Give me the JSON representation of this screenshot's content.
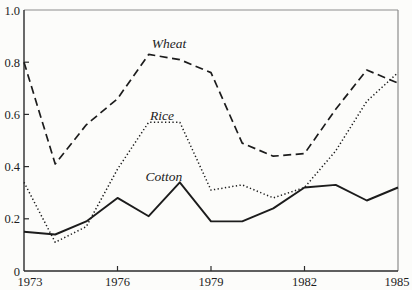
{
  "colors": {
    "background": "#fcfcfa",
    "line": "#1c1c1c",
    "axis_main": "#2b2b2b",
    "axis_frame": "#8c8c8c"
  },
  "chart_data": {
    "type": "line",
    "title": "",
    "xlabel": "",
    "ylabel": "",
    "grid": false,
    "legend_position": "inline-labels",
    "xlim": [
      1973,
      1985
    ],
    "ylim": [
      0,
      1.0
    ],
    "x": [
      1973,
      1974,
      1975,
      1976,
      1977,
      1978,
      1979,
      1980,
      1981,
      1982,
      1983,
      1984,
      1985
    ],
    "series": [
      {
        "name": "Wheat",
        "line_style": "dashed",
        "values": [
          0.8,
          0.41,
          0.56,
          0.66,
          0.83,
          0.81,
          0.76,
          0.49,
          0.44,
          0.45,
          0.62,
          0.77,
          0.72
        ]
      },
      {
        "name": "Rice",
        "line_style": "dotted",
        "values": [
          0.34,
          0.11,
          0.17,
          0.39,
          0.57,
          0.57,
          0.31,
          0.33,
          0.28,
          0.32,
          0.46,
          0.65,
          0.76
        ]
      },
      {
        "name": "Cotton",
        "line_style": "solid",
        "values": [
          0.15,
          0.14,
          0.19,
          0.28,
          0.21,
          0.34,
          0.19,
          0.19,
          0.24,
          0.32,
          0.33,
          0.27,
          0.32
        ]
      }
    ],
    "x_ticks": [
      {
        "label": "1973",
        "year": 1973,
        "has_mark": false
      },
      {
        "label": "1976",
        "year": 1976,
        "has_mark": true
      },
      {
        "label": "1979",
        "year": 1979,
        "has_mark": true
      },
      {
        "label": "1982",
        "year": 1982,
        "has_mark": true
      },
      {
        "label": "1985",
        "year": 1985,
        "has_mark": false
      }
    ],
    "y_ticks": [
      {
        "label": "1.0",
        "value": 1.0,
        "has_mark": false
      },
      {
        "label": "0.8",
        "value": 0.8,
        "has_mark": true
      },
      {
        "label": "0.6",
        "value": 0.6,
        "has_mark": true
      },
      {
        "label": "0.4",
        "value": 0.4,
        "has_mark": true
      },
      {
        "label": "0.2",
        "value": 0.2,
        "has_mark": true
      },
      {
        "label": "0",
        "value": 0.0,
        "has_mark": false
      }
    ]
  }
}
